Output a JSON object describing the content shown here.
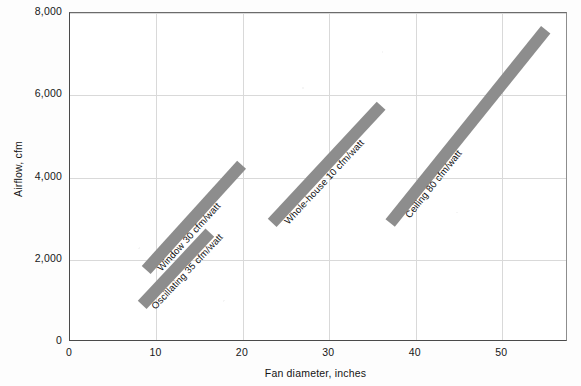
{
  "chart_data": {
    "type": "line",
    "title": "",
    "xlabel": "Fan diameter, inches",
    "ylabel": "Airflow, cfm",
    "xlim": [
      0,
      57.6
    ],
    "ylim": [
      0,
      8000
    ],
    "xticks": [
      "0",
      "10",
      "20",
      "30",
      "40",
      "50"
    ],
    "xtick_values": [
      0,
      10,
      20,
      30,
      40,
      50
    ],
    "yticks": [
      "0",
      "2,000",
      "4,000",
      "6,000",
      "8,000"
    ],
    "ytick_values": [
      0,
      2000,
      4000,
      6000,
      8000
    ],
    "grid": true,
    "legend": "inline-labels-on-bands",
    "series": [
      {
        "name": "Oscillating 35 cfm/watt",
        "label": "Oscillating  35 cfm/watt",
        "efficacy_cfm_per_watt": 35,
        "x": [
          8.3,
          16.1
        ],
        "y": [
          900,
          2650
        ],
        "band_color": "#8d8d8d"
      },
      {
        "name": "Window 30 cfm/watt",
        "label": "Window  30 cfm/watt",
        "efficacy_cfm_per_watt": 30,
        "x": [
          8.8,
          19.8
        ],
        "y": [
          1750,
          4300
        ],
        "band_color": "#8d8d8d"
      },
      {
        "name": "Whole-house 10 cfm/watt",
        "label": "Whole-house  10 cfm/watt",
        "efficacy_cfm_per_watt": 10,
        "x": [
          23.4,
          36.0
        ],
        "y": [
          2900,
          5750
        ],
        "band_color": "#8d8d8d"
      },
      {
        "name": "Ceiling 80 cfm/watt",
        "label": "Ceiling  80 cfm/watt",
        "efficacy_cfm_per_watt": 80,
        "x": [
          37.0,
          55.0
        ],
        "y": [
          2900,
          7600
        ],
        "band_color": "#8d8d8d"
      }
    ]
  }
}
